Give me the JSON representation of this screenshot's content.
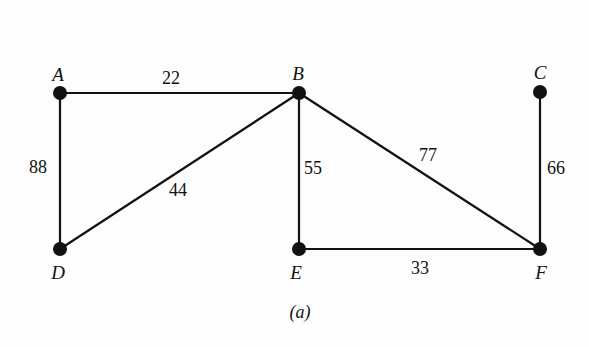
{
  "figure": {
    "caption": "(a)",
    "background_color": "#fdfdfd",
    "ink_color": "#111111"
  },
  "chart_data": {
    "type": "diagram",
    "subtype": "weighted-undirected-graph",
    "title": "(a)",
    "nodes": [
      {
        "id": "A",
        "label": "A",
        "x": 60,
        "y": 93,
        "label_x": 58,
        "label_y": 74,
        "radius": 7
      },
      {
        "id": "B",
        "label": "B",
        "x": 299,
        "y": 93,
        "label_x": 298,
        "label_y": 73,
        "radius": 7
      },
      {
        "id": "C",
        "label": "C",
        "x": 540,
        "y": 92,
        "label_x": 540,
        "label_y": 72,
        "radius": 7
      },
      {
        "id": "D",
        "label": "D",
        "x": 60,
        "y": 249,
        "label_x": 58,
        "label_y": 272,
        "radius": 7
      },
      {
        "id": "E",
        "label": "E",
        "x": 299,
        "y": 249,
        "label_x": 296,
        "label_y": 272,
        "radius": 7
      },
      {
        "id": "F",
        "label": "F",
        "x": 540,
        "y": 249,
        "label_x": 541,
        "label_y": 272,
        "radius": 7
      }
    ],
    "edges": [
      {
        "source": "A",
        "target": "B",
        "weight": 22,
        "label": "22",
        "label_x": 171,
        "label_y": 78
      },
      {
        "source": "A",
        "target": "D",
        "weight": 88,
        "label": "88",
        "label_x": 38,
        "label_y": 167
      },
      {
        "source": "D",
        "target": "B",
        "weight": 44,
        "label": "44",
        "label_x": 178,
        "label_y": 190
      },
      {
        "source": "B",
        "target": "E",
        "weight": 55,
        "label": "55",
        "label_x": 313,
        "label_y": 168
      },
      {
        "source": "B",
        "target": "F",
        "weight": 77,
        "label": "77",
        "label_x": 428,
        "label_y": 155
      },
      {
        "source": "C",
        "target": "F",
        "weight": 66,
        "label": "66",
        "label_x": 556,
        "label_y": 168
      },
      {
        "source": "E",
        "target": "F",
        "weight": 33,
        "label": "33",
        "label_x": 420,
        "label_y": 268
      }
    ],
    "edge_count": 7,
    "node_count": 6,
    "directed": false,
    "weighted": true
  }
}
